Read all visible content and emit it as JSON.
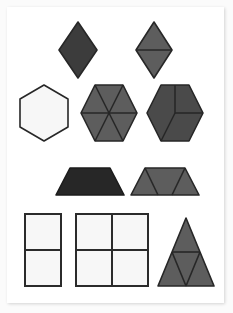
{
  "document": {
    "title": "Pattern Block Shape Decomposition Worksheet",
    "type": "geometry-figure-sheet",
    "background_color": "#fbfbfb",
    "card_color": "#ffffff"
  },
  "palette": {
    "dark_charcoal": "#3c3c3c",
    "near_black": "#272727",
    "medium_gray": "#5d5d5d",
    "dark_gray": "#4a4a4a",
    "white_fill": "#f7f7f7",
    "outline": "#2b2b2b",
    "divider": "#2b2b2b"
  },
  "rows": [
    {
      "row_index": 1,
      "name": "rhombus-row",
      "shapes": [
        "rhombus-whole",
        "rhombus-split-two-triangles"
      ]
    },
    {
      "row_index": 2,
      "name": "hexagon-row",
      "shapes": [
        "hexagon-whole",
        "hexagon-six-triangles",
        "hexagon-three-rhombi"
      ]
    },
    {
      "row_index": 3,
      "name": "trapezoid-row",
      "shapes": [
        "trapezoid-whole",
        "trapezoid-three-triangles"
      ]
    },
    {
      "row_index": 4,
      "name": "rectangle-row",
      "shapes": [
        "rectangle-two-squares",
        "square-four-squares",
        "triangle-four-triangles"
      ]
    }
  ],
  "shapes": [
    {
      "id": "rhombus-whole",
      "label": "Rhombus",
      "parts": 1,
      "fill": "#3c3c3c",
      "stroke": "#272727",
      "points": "78,22 97,50 78,78 59,50",
      "dividers": []
    },
    {
      "id": "rhombus-split-two-triangles",
      "label": "Rhombus split into 2 triangles",
      "parts": 2,
      "fill": "#5d5d5d",
      "stroke": "#272727",
      "points": "154,22 172,50 154,78 136,50",
      "dividers": [
        "136,50 172,50"
      ]
    },
    {
      "id": "hexagon-whole",
      "label": "Hexagon",
      "parts": 1,
      "fill": "#f7f7f7",
      "stroke": "#272727",
      "points": "44,85 68,99 68,127 44,141 20,127 20,99",
      "dividers": []
    },
    {
      "id": "hexagon-six-triangles",
      "label": "Hexagon split into 6 triangles",
      "parts": 6,
      "fill": "#5d5d5d",
      "stroke": "#272727",
      "points": "95,85 123,85 137,113 123,141 95,141 81,113",
      "dividers": [
        "109,113 95,85",
        "109,113 123,85",
        "109,113 137,113",
        "109,113 123,141",
        "109,113 95,141",
        "109,113 81,113"
      ]
    },
    {
      "id": "hexagon-three-rhombi",
      "label": "Hexagon split into 3 rhombi",
      "parts": 3,
      "fill": "#4a4a4a",
      "stroke": "#272727",
      "points": "161,85 189,85 203,113 189,141 161,141 147,113",
      "dividers": [
        "175,113 175,85",
        "175,113 203,113",
        "175,113 161,141"
      ]
    },
    {
      "id": "trapezoid-whole",
      "label": "Trapezoid",
      "parts": 1,
      "fill": "#272727",
      "stroke": "#1c1c1c",
      "points": "70,168 110,168 124,195 56,195",
      "dividers": []
    },
    {
      "id": "trapezoid-three-triangles",
      "label": "Trapezoid split into 3 triangles",
      "parts": 3,
      "fill": "#5d5d5d",
      "stroke": "#272727",
      "points": "145,168 185,168 199,195 131,195",
      "dividers": [
        "145,168 158,195",
        "185,168 172,195"
      ]
    },
    {
      "id": "rectangle-two-squares",
      "label": "Rectangle split into 2 squares",
      "parts": 2,
      "fill": "#f7f7f7",
      "stroke": "#2b2b2b",
      "points": "25,214 61,214 61,286 25,286",
      "dividers": [
        "25,250 61,250"
      ]
    },
    {
      "id": "square-four-squares",
      "label": "Square split into 4 squares",
      "parts": 4,
      "fill": "#f7f7f7",
      "stroke": "#2b2b2b",
      "points": "76,214 148,214 148,286 76,286",
      "dividers": [
        "76,250 148,250",
        "112,214 112,286"
      ]
    },
    {
      "id": "triangle-four-triangles",
      "label": "Triangle split into 4 triangles",
      "parts": 4,
      "fill": "#5d5d5d",
      "stroke": "#272727",
      "points": "186,218 214,286 158,286"
    }
  ],
  "triangle_subdivision": {
    "dividers": [
      "172,252 200,252",
      "172,252 186,286",
      "200,252 186,286"
    ]
  }
}
